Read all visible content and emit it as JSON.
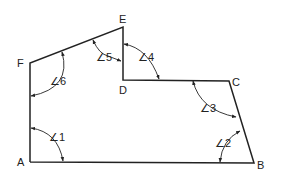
{
  "diagram": {
    "type": "polygon-angles",
    "vertices": [
      {
        "name": "A",
        "label": "A",
        "x": 30,
        "y": 162
      },
      {
        "name": "B",
        "label": "B",
        "x": 254,
        "y": 163
      },
      {
        "name": "C",
        "label": "C",
        "x": 229,
        "y": 81
      },
      {
        "name": "D",
        "label": "D",
        "x": 123,
        "y": 80
      },
      {
        "name": "E",
        "label": "E",
        "x": 123,
        "y": 27
      },
      {
        "name": "F",
        "label": "F",
        "x": 30,
        "y": 63
      }
    ],
    "angles": [
      {
        "id": "1",
        "label": "∠1",
        "vertex": "A"
      },
      {
        "id": "2",
        "label": "∠2",
        "vertex": "B"
      },
      {
        "id": "3",
        "label": "∠3",
        "vertex": "C"
      },
      {
        "id": "4",
        "label": "∠4",
        "vertex": "D"
      },
      {
        "id": "5",
        "label": "∠5",
        "vertex": "E"
      },
      {
        "id": "6",
        "label": "∠6",
        "vertex": "F"
      }
    ]
  }
}
